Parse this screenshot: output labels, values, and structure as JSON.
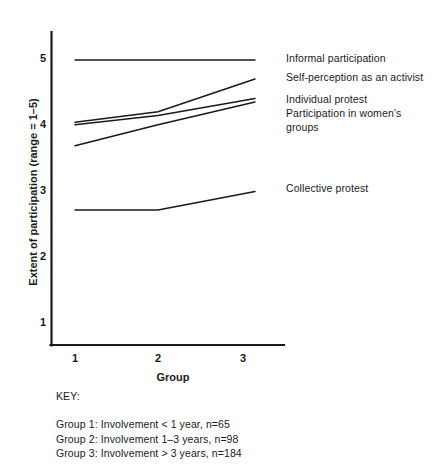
{
  "chart_data": {
    "type": "line",
    "title": "",
    "xlabel": "Group",
    "ylabel": "Extent of participation (range = 1–5)",
    "x": [
      1,
      2,
      3
    ],
    "xticklabels": [
      "1",
      "2",
      "3"
    ],
    "yticklabels": [
      "1",
      "2",
      "3",
      "4",
      "5"
    ],
    "ylim": [
      0.5,
      5.4
    ],
    "xlim": [
      0.72,
      3.5
    ],
    "grid": false,
    "legend_position": "right-of-plot (direct line labels)",
    "series": [
      {
        "name": "Informal participation",
        "values": [
          4.97,
          4.97,
          4.97
        ],
        "color": "#1a1a1a"
      },
      {
        "name": "Self-perception as an activist",
        "values": [
          4.02,
          4.18,
          4.68
        ],
        "color": "#1a1a1a"
      },
      {
        "name": "Individual protest",
        "values": [
          3.98,
          4.12,
          4.38
        ],
        "color": "#1a1a1a"
      },
      {
        "name": "Participation in women's groups",
        "values": [
          3.66,
          3.98,
          4.33
        ],
        "color": "#1a1a1a"
      },
      {
        "name": "Collective protest",
        "values": [
          2.68,
          2.68,
          2.96
        ],
        "color": "#1a1a1a"
      }
    ]
  },
  "axes": {
    "y_ticks": [
      {
        "label": "5",
        "value": 5
      },
      {
        "label": "4",
        "value": 4
      },
      {
        "label": "3",
        "value": 3
      },
      {
        "label": "2",
        "value": 2
      },
      {
        "label": "1",
        "value": 1
      }
    ],
    "x_ticks": [
      {
        "label": "1",
        "value": 1
      },
      {
        "label": "2",
        "value": 2
      },
      {
        "label": "3",
        "value": 3
      }
    ],
    "x_title": "Group",
    "y_title": "Extent of participation (range = 1–5)"
  },
  "series_labels": [
    {
      "text": "Informal participation",
      "name": "label-informal-participation"
    },
    {
      "text": "Self-perception as an activist",
      "name": "label-self-perception"
    },
    {
      "text": "Individual protest\nParticipation in women’s\ngroups",
      "name": "label-individual-protest-and-womens-groups"
    },
    {
      "text": "Collective protest",
      "name": "label-collective-protest"
    }
  ],
  "key": {
    "heading": "KEY:",
    "lines": [
      "Group 1: Involvement < 1 year, n=65",
      "Group 2: Involvement 1–3 years, n=98",
      "Group 3: Involvement > 3 years, n=184"
    ]
  },
  "colors": {
    "line": "#1a1a1a",
    "axis": "#1a1a1a",
    "background": "#ffffff"
  }
}
